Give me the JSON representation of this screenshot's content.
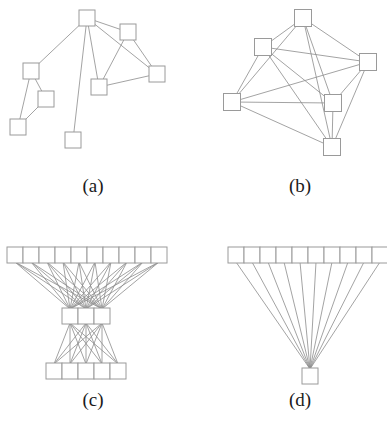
{
  "figure": {
    "title": "",
    "background_color": "#ffffff",
    "node_fill": "#ffffff",
    "node_stroke": "#9a9a9a",
    "edge_color": "#8c8c8c",
    "label_color": "#1a1a1a",
    "panel_count": 4
  },
  "panels": [
    {
      "id": "a",
      "label": "(a)",
      "label_x": 93,
      "label_y": 192,
      "type": "sparse-tree-like-graph",
      "node_size": 16,
      "nodes": [
        {
          "id": "a0",
          "x": 87,
          "y": 18
        },
        {
          "id": "a1",
          "x": 128,
          "y": 32
        },
        {
          "id": "a2",
          "x": 157,
          "y": 74
        },
        {
          "id": "a3",
          "x": 99,
          "y": 87
        },
        {
          "id": "a4",
          "x": 31,
          "y": 71
        },
        {
          "id": "a5",
          "x": 46,
          "y": 99
        },
        {
          "id": "a6",
          "x": 18,
          "y": 127
        },
        {
          "id": "a7",
          "x": 73,
          "y": 140
        }
      ],
      "edges": [
        [
          "a0",
          "a1"
        ],
        [
          "a0",
          "a2"
        ],
        [
          "a0",
          "a3"
        ],
        [
          "a0",
          "a4"
        ],
        [
          "a0",
          "a7"
        ],
        [
          "a1",
          "a2"
        ],
        [
          "a1",
          "a3"
        ],
        [
          "a2",
          "a3"
        ],
        [
          "a4",
          "a5"
        ],
        [
          "a4",
          "a6"
        ],
        [
          "a5",
          "a6"
        ]
      ]
    },
    {
      "id": "b",
      "label": "(b)",
      "label_x": 300,
      "label_y": 192,
      "type": "dense-near-complete-graph",
      "node_size": 17,
      "nodes": [
        {
          "id": "b0",
          "x": 303,
          "y": 18
        },
        {
          "id": "b1",
          "x": 263,
          "y": 47
        },
        {
          "id": "b2",
          "x": 368,
          "y": 62
        },
        {
          "id": "b3",
          "x": 232,
          "y": 102
        },
        {
          "id": "b4",
          "x": 333,
          "y": 103
        },
        {
          "id": "b5",
          "x": 332,
          "y": 147
        }
      ],
      "edges": [
        [
          "b0",
          "b1"
        ],
        [
          "b0",
          "b2"
        ],
        [
          "b0",
          "b3"
        ],
        [
          "b0",
          "b4"
        ],
        [
          "b0",
          "b5"
        ],
        [
          "b1",
          "b2"
        ],
        [
          "b1",
          "b3"
        ],
        [
          "b1",
          "b4"
        ],
        [
          "b1",
          "b5"
        ],
        [
          "b2",
          "b3"
        ],
        [
          "b2",
          "b4"
        ],
        [
          "b2",
          "b5"
        ],
        [
          "b3",
          "b4"
        ],
        [
          "b3",
          "b5"
        ],
        [
          "b4",
          "b5"
        ]
      ]
    },
    {
      "id": "c",
      "label": "(c)",
      "label_x": 93,
      "label_y": 406,
      "type": "layered-complete-bipartite-stack",
      "cell_width": 16,
      "cell_height": 16,
      "layers": [
        {
          "name": "top-row",
          "count": 10,
          "x_start": 7,
          "y": 247
        },
        {
          "name": "middle-row",
          "count": 3,
          "x_start": 62,
          "y": 308
        },
        {
          "name": "bottom-row",
          "count": 5,
          "x_start": 46,
          "y": 363
        }
      ],
      "connections": [
        {
          "from_layer": 0,
          "to_layer": 1,
          "pattern": "complete-bipartite"
        },
        {
          "from_layer": 1,
          "to_layer": 2,
          "pattern": "complete-bipartite"
        }
      ]
    },
    {
      "id": "d",
      "label": "(d)",
      "label_x": 300,
      "label_y": 406,
      "type": "star-fan-graph",
      "cell_width": 16,
      "cell_height": 16,
      "layers": [
        {
          "name": "top-row",
          "count": 10,
          "x_start": 228,
          "y": 247
        },
        {
          "name": "sink-node",
          "count": 1,
          "x_start": 302,
          "y": 368
        }
      ],
      "connections": [
        {
          "from_layer": 0,
          "to_layer": 1,
          "pattern": "fan-to-single-sink"
        }
      ]
    }
  ]
}
